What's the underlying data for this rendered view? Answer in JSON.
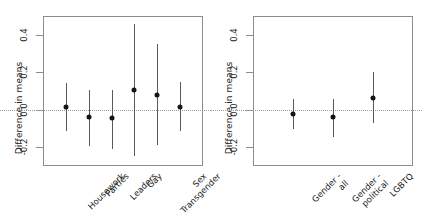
{
  "figure": {
    "background": "#ffffff",
    "point_color": "#141414",
    "bar_color": "#5a5a5a",
    "frame_color": "#8c8c8c",
    "zero_line_color": "#9a9a9a"
  },
  "panels": [
    {
      "id": "left",
      "ylabel": "Difference in means",
      "yticks": [
        "0.4",
        "0.2",
        "0.0",
        "-0.2"
      ],
      "categories": [
        "Housework",
        "Parties",
        "Leaders",
        "Gay",
        "Transgender",
        "Sex"
      ]
    },
    {
      "id": "right",
      "ylabel": "Difference in means",
      "yticks": [
        "0.4",
        "0.2",
        "0.0",
        "-0.2"
      ],
      "categories": [
        "Gender -\nall",
        "Gender -\npolitical",
        "LGBTQ"
      ]
    }
  ],
  "chart_data": [
    {
      "type": "scatter",
      "title": "",
      "panel": "left",
      "xlabel": "",
      "ylabel": "Difference in means",
      "ylim": [
        -0.3,
        0.5
      ],
      "ytick_values": [
        0.4,
        0.2,
        0.0,
        -0.2
      ],
      "ytick_labels": [
        "0.4",
        "0.2",
        "0.0",
        "-0.2"
      ],
      "grid": false,
      "legend": "none",
      "zero_reference_line": 0.0,
      "categories": [
        "Housework",
        "Parties",
        "Leaders",
        "Gay",
        "Transgender",
        "Sex"
      ],
      "values": [
        0.015,
        -0.04,
        -0.045,
        0.105,
        0.08,
        0.015
      ],
      "ci_low": [
        -0.115,
        -0.195,
        -0.21,
        -0.245,
        -0.19,
        -0.115
      ],
      "ci_high": [
        0.145,
        0.105,
        0.105,
        0.455,
        0.35,
        0.15
      ]
    },
    {
      "type": "scatter",
      "title": "",
      "panel": "right",
      "xlabel": "",
      "ylabel": "Difference in means",
      "ylim": [
        -0.3,
        0.5
      ],
      "ytick_values": [
        0.4,
        0.2,
        0.0,
        -0.2
      ],
      "ytick_labels": [
        "0.4",
        "0.2",
        "0.0",
        "-0.2"
      ],
      "grid": false,
      "legend": "none",
      "zero_reference_line": 0.0,
      "categories": [
        "Gender - all",
        "Gender - political",
        "LGBTQ"
      ],
      "values": [
        -0.02,
        -0.04,
        0.065
      ],
      "ci_low": [
        -0.1,
        -0.145,
        -0.07
      ],
      "ci_high": [
        0.055,
        0.06,
        0.2
      ]
    }
  ]
}
